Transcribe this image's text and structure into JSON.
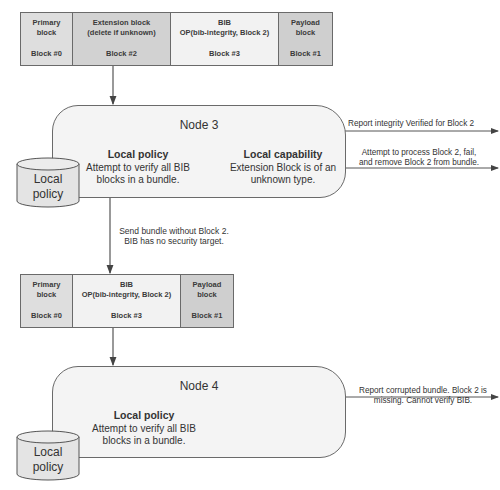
{
  "colors": {
    "primary_block": "#dedede",
    "extension_block": "#d2d2d2",
    "bib_block": "#f2f2f2",
    "payload_block": "#cfcfcf",
    "node_fill": "#f4f4f4",
    "cylinder_fill": "#e4e4e4",
    "line": "#555555"
  },
  "bundle_top": {
    "blocks": [
      {
        "name": "Primary\nblock",
        "number": "Block #0"
      },
      {
        "name": "Extension block\n(delete if unknown)",
        "number": "Block #2"
      },
      {
        "name": "BIB\nOP(bib-integrity, Block 2)",
        "number": "Block #3"
      },
      {
        "name": "Payload\nblock",
        "number": "Block #1"
      }
    ]
  },
  "node3": {
    "title": "Node 3",
    "local_policy": {
      "heading": "Local policy",
      "text": "Attempt to verify all BIB\nblocks in a bundle."
    },
    "local_capability": {
      "heading": "Local capability",
      "text": "Extension Block is of an\nunknown type."
    },
    "storage_label": "Local\npolicy",
    "outputs": [
      {
        "label": "Report integrity Verified for Block 2"
      },
      {
        "label": "Attempt to process Block 2, fail,\nand remove Block 2 from bundle."
      }
    ]
  },
  "transfer_label": "Send bundle without Block 2.\nBIB has no security target.",
  "bundle_bottom": {
    "blocks": [
      {
        "name": "Primary\nblock",
        "number": "Block #0"
      },
      {
        "name": "BIB\nOP(bib-integrity, Block 2)",
        "number": "Block #3"
      },
      {
        "name": "Payload\nblock",
        "number": "Block #1"
      }
    ]
  },
  "node4": {
    "title": "Node 4",
    "local_policy": {
      "heading": "Local policy",
      "text": "Attempt to verify all BIB\nblocks in a bundle."
    },
    "storage_label": "Local\npolicy",
    "outputs": [
      {
        "label": "Report corrupted bundle. Block 2 is\nmissing. Cannot verify BIB."
      }
    ]
  }
}
